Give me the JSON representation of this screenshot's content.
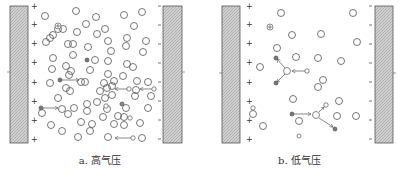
{
  "figure": {
    "panels": [
      {
        "id": "a",
        "caption": "a. 高气压",
        "anode_signs": [
          "+",
          "+",
          "+",
          "+",
          "+",
          "+",
          "+",
          "+"
        ],
        "cathode_signs": [
          "-",
          "-",
          "-",
          "-",
          "-",
          "-",
          "-",
          "-"
        ]
      },
      {
        "id": "b",
        "caption": "b. 低气压",
        "anode_signs": [
          "+",
          "+",
          "+",
          "+",
          "+",
          "+",
          "+",
          "+"
        ],
        "cathode_signs": [
          "-",
          "-",
          "-",
          "-",
          "-",
          "-",
          "-",
          "-"
        ]
      }
    ],
    "colors": {
      "electrode_fill": "#c8c8c8",
      "electrode_stroke": "#555555",
      "molecule_stroke": "#555555",
      "particle_fill": "#777777",
      "text": "#333333"
    }
  }
}
